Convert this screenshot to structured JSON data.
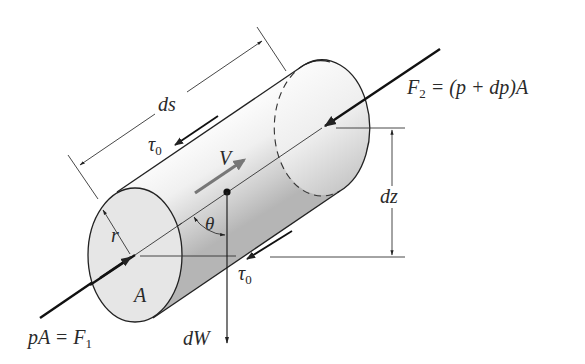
{
  "diagram": {
    "labels": {
      "length": "ds",
      "shear_top": "τ",
      "shear_top_sub": "0",
      "shear_bottom": "τ",
      "shear_bottom_sub": "0",
      "velocity": "V",
      "radius": "r",
      "angle": "θ",
      "area": "A",
      "elevation_change": "dz",
      "weight": "dW",
      "force_in_lhs": "pA = F",
      "force_in_sub": "1",
      "force_out_lhs": "F",
      "force_out_sub": "2",
      "force_out_rhs": " = (p + dp)A"
    },
    "elements": [
      {
        "id": "cylinder",
        "desc": "cylindrical fluid element inclined upward to the right"
      },
      {
        "id": "F1",
        "desc": "pressure force on upstream face, pointing along axis into element"
      },
      {
        "id": "F2",
        "desc": "pressure force on downstream face, pointing along axis into element"
      },
      {
        "id": "tau0",
        "desc": "wall shear stress opposing flow, top and bottom"
      },
      {
        "id": "V",
        "desc": "flow velocity along axis (gray arrow)"
      },
      {
        "id": "dW",
        "desc": "weight acting vertically downward from centroid"
      },
      {
        "id": "theta",
        "desc": "angle between axis and vertical"
      },
      {
        "id": "dz",
        "desc": "vertical rise between end centers"
      },
      {
        "id": "ds",
        "desc": "length of element"
      },
      {
        "id": "r",
        "desc": "radius of element"
      }
    ],
    "colors": {
      "stroke": "#222222",
      "velocity_arrow": "#777777",
      "cap_fill": "#e6e6e6",
      "body_light": "#fafafa",
      "body_dark": "#b8b8b8"
    }
  }
}
